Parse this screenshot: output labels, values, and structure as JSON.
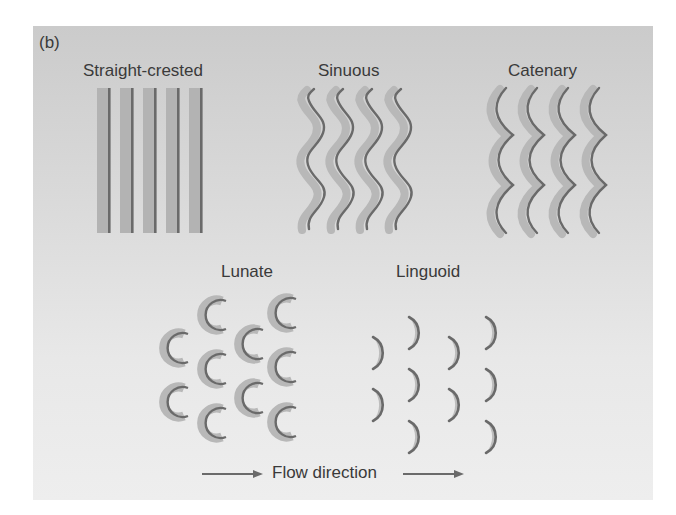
{
  "figure": {
    "panel_label": "(b)",
    "colors": {
      "crest": "#6a6a6a",
      "shadow": "#b3b3b3",
      "text": "#3a3a3a",
      "panel_top": "#cbcbcb",
      "panel_bottom": "#eeeeee"
    },
    "forms": [
      {
        "name": "Straight-crested",
        "pattern": "parallel straight crest lines",
        "crest_count": 5
      },
      {
        "name": "Sinuous",
        "pattern": "in-phase wavy crest lines",
        "crest_count": 4
      },
      {
        "name": "Catenary",
        "pattern": "chains of linked concave arcs",
        "crest_count": 4
      },
      {
        "name": "Lunate",
        "pattern": "staggered crescents, horns pointing downflow",
        "element_count": 10
      },
      {
        "name": "Linguoid",
        "pattern": "staggered tongue-shaped crescents, convex downflow",
        "element_count": 10
      }
    ],
    "flow_label": "Flow direction",
    "flow_arrow": "left-to-right"
  }
}
